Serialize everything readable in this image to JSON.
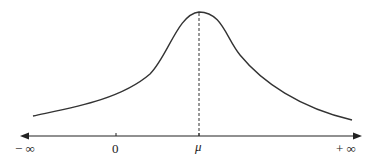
{
  "diagram": {
    "type": "bell-curve-distribution",
    "curve_color": "#333333",
    "axis_color": "#222222",
    "axis_labels": {
      "neg_inf": "− ∞",
      "zero": "0",
      "mu": "μ",
      "pos_inf": "+ ∞"
    },
    "peak_marker": "dashed vertical line at μ"
  }
}
